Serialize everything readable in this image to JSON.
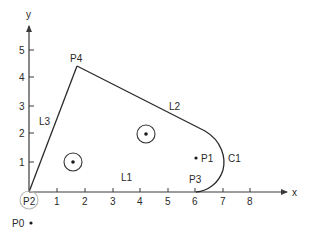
{
  "diagram": {
    "axes": {
      "x_label": "x",
      "y_label": "y",
      "x_ticks": [
        "1",
        "2",
        "3",
        "4",
        "5",
        "6",
        "7",
        "8"
      ],
      "y_ticks": [
        "1",
        "2",
        "3",
        "4",
        "5"
      ]
    },
    "points": {
      "p0": "P0",
      "p1": "P1",
      "p2": "P2",
      "p3": "P3",
      "p4": "P4"
    },
    "segments": {
      "l1": "L1",
      "l2": "L2",
      "l3": "L3",
      "c1": "C1"
    },
    "colors": {
      "line": "#2a2a2a",
      "p2_marker": "#b8b8b8"
    }
  }
}
